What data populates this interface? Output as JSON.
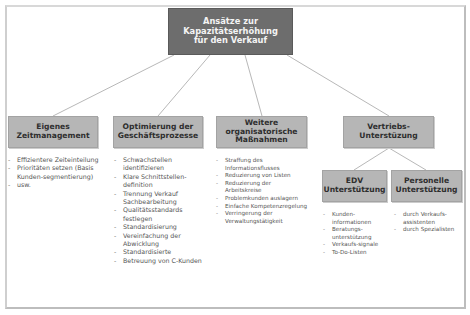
{
  "diagram": {
    "root": {
      "label_lines": [
        "Ansätze zur",
        "Kapazitätserhöhung",
        "für den Verkauf"
      ]
    },
    "colors": {
      "root_fill": "#6d6d6d",
      "node_fill": "#b6b6b6",
      "line": "#b8b8b8",
      "frame": "#c4c4c4"
    },
    "nodes": [
      {
        "label_lines": [
          "Eigenes",
          "Zeitmanagement"
        ],
        "items": [
          "Effizientere Zeiteinteilung",
          "Prioritäten setzen (Basis Kunden-segmentierung)",
          "usw."
        ]
      },
      {
        "label_lines": [
          "Optimierung der",
          "Geschäftsprozesse"
        ],
        "items": [
          "Schwachstellen identifizieren",
          "Klare Schnittstellen-definition",
          "Trennung Verkauf Sachbearbeitung",
          "Qualitätsstandards festlegen",
          "Standardisierung",
          "Vereinfachung der Abwicklung",
          "Standardisierte",
          "Betreuung von C-Kunden"
        ]
      },
      {
        "label_lines": [
          "Weitere",
          "organisatorische",
          "Maßnahmen"
        ],
        "items": [
          "Straffung des Informationsflusses",
          "Reduzierung von Listen",
          "Reduzierung der Arbeitskreise",
          "Problemkunden auslagern",
          "Einfache Kompetenzregelung",
          "Verringerung der Verwaltungstätigkeit"
        ]
      },
      {
        "label_lines": [
          "Vertriebs-",
          "Unterstüzung"
        ],
        "children": [
          {
            "label_lines": [
              "EDV",
              "Unterstützung"
            ],
            "items": [
              "Kunden-informationen",
              "Beratungs-unterstützung",
              "Verkaufs-signale",
              "To-Do-Listen"
            ]
          },
          {
            "label_lines": [
              "Personelle",
              "Unterstützung"
            ],
            "items": [
              "durch Verkaufs-assistenten",
              "durch Spezialisten"
            ]
          }
        ]
      }
    ]
  }
}
